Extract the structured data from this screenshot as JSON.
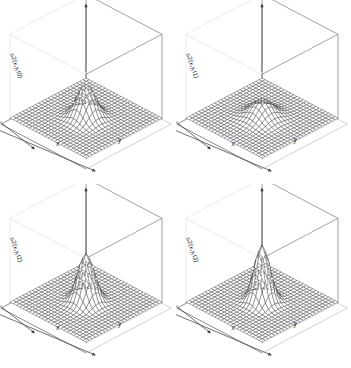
{
  "figure": {
    "background_color": "#ffffff",
    "width": 351,
    "height": 368,
    "layout": "2x2 grid of 3D surface (mesh) plots",
    "line_color": "#333333"
  },
  "panels": [
    {
      "id": "panel-t0",
      "zlabel": "u2(x,y,t0)",
      "xlabel": "x",
      "ylabel": "y",
      "peak_amplitude": 0.55,
      "peak_width": 0.18,
      "time_label": "t0"
    },
    {
      "id": "panel-t1",
      "zlabel": "u2(x,y,t1)",
      "xlabel": "x",
      "ylabel": "y",
      "peak_amplitude": 0.3,
      "peak_width": 0.22,
      "time_label": "t1"
    },
    {
      "id": "panel-t2",
      "zlabel": "u2(x,y,t2)",
      "xlabel": "x",
      "ylabel": "y",
      "peak_amplitude": 0.78,
      "peak_width": 0.16,
      "time_label": "t2"
    },
    {
      "id": "panel-t3",
      "zlabel": "u2(x,y,t3)",
      "xlabel": "x",
      "ylabel": "y",
      "peak_amplitude": 0.92,
      "peak_width": 0.15,
      "time_label": "t3"
    }
  ],
  "chart_data": {
    "type": "line",
    "title": "",
    "subtitle": "",
    "xlabel": "x",
    "ylabel": "y",
    "zlabel": "u2(x,y,t)",
    "grid": true,
    "legend_position": "none",
    "surface_plots": [
      {
        "name": "u2(x,y,t0)",
        "function": "gaussian-like radial pulse",
        "amplitude": 0.55,
        "sigma": 0.18,
        "mesh_nx": 24,
        "mesh_ny": 24,
        "xlim": [
          -1,
          1
        ],
        "ylim": [
          -1,
          1
        ],
        "zlim": [
          0,
          1
        ]
      },
      {
        "name": "u2(x,y,t1)",
        "function": "gaussian-like radial pulse",
        "amplitude": 0.3,
        "sigma": 0.22,
        "mesh_nx": 24,
        "mesh_ny": 24,
        "xlim": [
          -1,
          1
        ],
        "ylim": [
          -1,
          1
        ],
        "zlim": [
          0,
          1
        ]
      },
      {
        "name": "u2(x,y,t2)",
        "function": "gaussian-like radial pulse",
        "amplitude": 0.78,
        "sigma": 0.16,
        "mesh_nx": 24,
        "mesh_ny": 24,
        "xlim": [
          -1,
          1
        ],
        "ylim": [
          -1,
          1
        ],
        "zlim": [
          0,
          1
        ]
      },
      {
        "name": "u2(x,y,t3)",
        "function": "gaussian-like radial pulse",
        "amplitude": 0.92,
        "sigma": 0.15,
        "mesh_nx": 24,
        "mesh_ny": 24,
        "xlim": [
          -1,
          1
        ],
        "ylim": [
          -1,
          1
        ],
        "zlim": [
          0,
          1
        ]
      }
    ]
  }
}
